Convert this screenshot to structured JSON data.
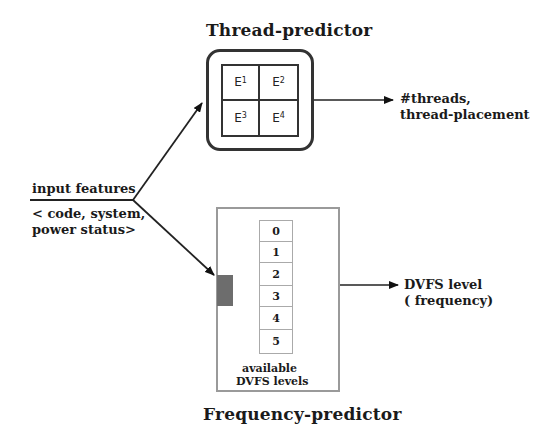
{
  "thread_predictor": {
    "title": "Thread-predictor",
    "experts": [
      {
        "base": "E",
        "sup": "1"
      },
      {
        "base": "E",
        "sup": "2"
      },
      {
        "base": "E",
        "sup": "3"
      },
      {
        "base": "E",
        "sup": "4"
      }
    ],
    "output_line1": "#threads,",
    "output_line2": "thread-placement"
  },
  "input": {
    "label": "input features",
    "desc_line1": "< code, system,",
    "desc_line2": "power status>"
  },
  "frequency_predictor": {
    "title": "Frequency-predictor",
    "levels": [
      "0",
      "1",
      "2",
      "3",
      "4",
      "5"
    ],
    "levels_caption_line1": "available",
    "levels_caption_line2": "DVFS levels",
    "output_line1": "DVFS level",
    "output_line2": "( frequency)"
  },
  "colors": {
    "stroke": "#222222",
    "light_border": "#9a9a9a",
    "selector": "#6d6d6d"
  }
}
